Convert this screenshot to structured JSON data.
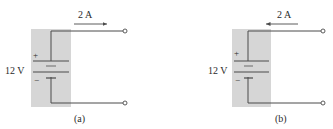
{
  "colors": {
    "shade": "#d6d6d6",
    "wire": "#4a4a4a",
    "text": "#2b2b2b",
    "background": "#ffffff"
  },
  "panels": [
    {
      "caption": "(a)",
      "voltage_label": "12 V",
      "current_label": "2 A",
      "current_direction": "right",
      "plus_sign": "+",
      "minus_sign_inner": "−",
      "minus_sign_outer": "−"
    },
    {
      "caption": "(b)",
      "voltage_label": "12 V",
      "current_label": "2 A",
      "current_direction": "left",
      "plus_sign": "+",
      "minus_sign_inner": "−",
      "minus_sign_outer": "−"
    }
  ]
}
